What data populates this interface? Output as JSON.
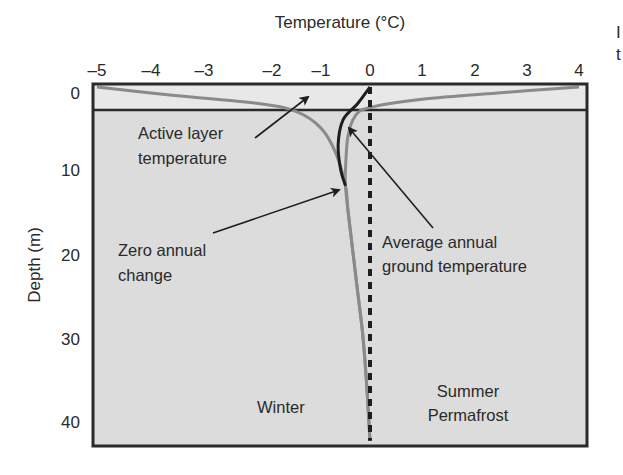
{
  "chart_data": {
    "type": "line",
    "title": "",
    "xlabel": "Temperature (°C)",
    "ylabel": "Depth (m)",
    "xlim": [
      -5,
      4
    ],
    "ylim": [
      43,
      0
    ],
    "x_axis_position": "top",
    "x_ticks": [
      -5,
      -4,
      -3,
      -2,
      -1,
      0,
      1,
      2,
      3,
      4
    ],
    "x_tick_labels": [
      "–5",
      "–4",
      "–3",
      "–2",
      "–1",
      "0",
      "1",
      "2",
      "3",
      "4"
    ],
    "y_ticks": [
      0,
      10,
      20,
      30,
      40
    ],
    "y_tick_labels": [
      "0",
      "10",
      "20",
      "30",
      "40"
    ],
    "grid": false,
    "legend": null,
    "active_layer_depth": 2.3,
    "series": [
      {
        "name": "Winter",
        "style": "gray solid",
        "color": "#8a8a8a",
        "points": [
          [
            -5,
            0
          ],
          [
            -3.6,
            1
          ],
          [
            -2.2,
            2
          ],
          [
            -1.5,
            3
          ],
          [
            -1.0,
            5
          ],
          [
            -0.7,
            8
          ],
          [
            -0.5,
            12
          ],
          [
            -0.45,
            15
          ],
          [
            -0.35,
            20
          ],
          [
            -0.25,
            25
          ],
          [
            -0.15,
            30
          ],
          [
            -0.07,
            36
          ],
          [
            0,
            43
          ]
        ]
      },
      {
        "name": "Summer",
        "style": "gray solid",
        "color": "#8a8a8a",
        "points": [
          [
            4,
            0
          ],
          [
            2.5,
            0.7
          ],
          [
            1,
            1.5
          ],
          [
            0,
            2.5
          ],
          [
            -0.3,
            3.5
          ],
          [
            -0.45,
            6
          ],
          [
            -0.5,
            10
          ],
          [
            -0.5,
            12
          ],
          [
            -0.45,
            15
          ],
          [
            -0.35,
            20
          ],
          [
            -0.25,
            25
          ],
          [
            -0.15,
            30
          ],
          [
            -0.07,
            36
          ],
          [
            0,
            43
          ]
        ]
      },
      {
        "name": "Average annual ground temperature",
        "style": "black solid",
        "color": "#1e1e1e",
        "points": [
          [
            0,
            0
          ],
          [
            -0.25,
            2
          ],
          [
            -0.55,
            4
          ],
          [
            -0.65,
            7
          ],
          [
            -0.6,
            10
          ],
          [
            -0.5,
            12
          ]
        ]
      },
      {
        "name": "0 °C reference",
        "style": "black dashed",
        "color": "#1e1e1e",
        "points": [
          [
            0,
            0
          ],
          [
            0,
            43
          ]
        ]
      }
    ],
    "annotations": [
      {
        "text": "Active layer temperature",
        "lines": [
          "Active layer",
          "temperature"
        ],
        "arrow_to": [
          -1.3,
          1.0
        ]
      },
      {
        "text": "Zero annual change",
        "lines": [
          "Zero annual",
          "change"
        ],
        "arrow_to": [
          -0.5,
          12
        ]
      },
      {
        "text": "Average annual ground temperature",
        "lines": [
          "Average annual",
          "ground temperature"
        ],
        "arrow_to": [
          -0.55,
          4.5
        ]
      },
      {
        "text": "Winter",
        "lines": [
          "Winter"
        ]
      },
      {
        "text": "Summer Permafrost",
        "lines": [
          "Summer",
          "Permafrost"
        ]
      }
    ]
  },
  "labels": {
    "x_title": "Temperature (°C)",
    "y_title": "Depth (m)",
    "ann_active_1": "Active layer",
    "ann_active_2": "temperature",
    "ann_zero_1": "Zero annual",
    "ann_zero_2": "change",
    "ann_avg_1": "Average annual",
    "ann_avg_2": "ground temperature",
    "winter": "Winter",
    "summer": "Summer",
    "permafrost": "Permafrost",
    "cut_right_1": "I",
    "cut_right_2": "t"
  },
  "colors": {
    "plot_bg": "#dcdcdc",
    "active_layer_bg": "#e8e8e8",
    "frame": "#2a2a2a",
    "curve_gray": "#8a8a8a",
    "curve_black": "#1e1e1e"
  }
}
